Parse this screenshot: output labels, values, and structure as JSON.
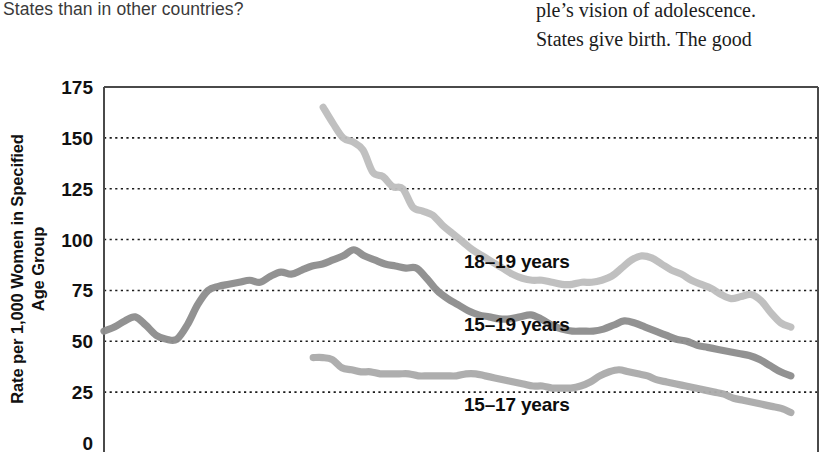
{
  "page_text": {
    "left_column": "States than in other countries?",
    "right_column": {
      "line1": "ple’s vision of adolescence.",
      "line2": "States give birth. The good"
    }
  },
  "figure": {
    "y_axis_title_line1": "Rate per 1,000 Women in Specified",
    "y_axis_title_line2": "Age Group",
    "series_label_1": "18–19 years",
    "series_label_2": "15–19 years",
    "series_label_3": "15–17 years"
  },
  "chart_data": {
    "type": "line",
    "title": "",
    "xlabel": "",
    "ylabel": "Rate per 1,000 Women in Specified Age Group",
    "ylim": [
      0,
      175
    ],
    "yticks": [
      0,
      25,
      50,
      75,
      100,
      125,
      150,
      175
    ],
    "ytick_labels": [
      "0",
      "25",
      "50",
      "75",
      "100",
      "125",
      "150",
      "175"
    ],
    "grid": "horizontal-dotted",
    "legend": "inline-labels",
    "colors": {
      "series_18_19": "#bdbdbd",
      "series_15_19": "#8e8e8e",
      "series_15_17": "#ababab",
      "axis": "#4a4a4a",
      "gridline": "#1c1c1c"
    },
    "series": [
      {
        "name": "18–19 years",
        "color": "#bdbdbd",
        "x_start_frac": 0.307,
        "values": [
          165,
          157,
          150,
          148,
          144,
          133,
          131,
          126,
          125,
          116,
          114,
          112,
          107,
          103,
          99,
          95,
          92,
          89,
          86,
          83,
          81,
          80,
          80,
          79,
          78,
          78,
          79,
          79,
          80,
          82,
          86,
          90,
          92,
          91,
          88,
          85,
          83,
          80,
          78,
          76,
          73,
          71,
          72,
          73,
          70,
          64,
          59,
          57
        ]
      },
      {
        "name": "15–19 years",
        "color": "#8e8e8e",
        "x_start_frac": 0.0,
        "values": [
          55,
          57,
          60,
          62,
          58,
          53,
          51,
          51,
          58,
          68,
          75,
          77,
          78,
          79,
          80,
          79,
          82,
          84,
          83,
          85,
          87,
          88,
          90,
          92,
          95,
          92,
          90,
          88,
          87,
          86,
          86,
          81,
          75,
          71,
          68,
          65,
          63,
          62,
          61,
          61,
          62,
          63,
          61,
          58,
          56,
          55,
          55,
          55,
          56,
          58,
          60,
          59,
          57,
          55,
          53,
          51,
          50,
          48,
          47,
          46,
          45,
          44,
          43,
          41,
          38,
          35,
          33
        ]
      },
      {
        "name": "15–17 years",
        "color": "#ababab",
        "x_start_frac": 0.293,
        "values": [
          42,
          42,
          41,
          37,
          36,
          35,
          35,
          34,
          34,
          34,
          34,
          33,
          33,
          33,
          33,
          33,
          34,
          34,
          33,
          32,
          31,
          30,
          29,
          28,
          28,
          27,
          27,
          27,
          28,
          30,
          33,
          35,
          36,
          35,
          34,
          33,
          31,
          30,
          29,
          28,
          27,
          26,
          25,
          24,
          22,
          21,
          20,
          19,
          18,
          17,
          15
        ]
      }
    ]
  }
}
